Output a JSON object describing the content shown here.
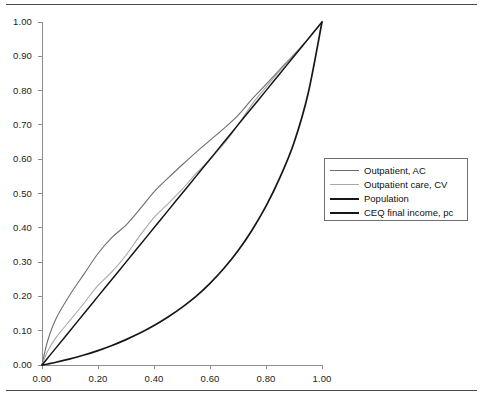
{
  "figure": {
    "name": "lorenz-concentration-curve-figure",
    "has_top_rule": true,
    "has_bottom_rule": true
  },
  "legend": {
    "position": "right-middle",
    "entries": [
      {
        "label": "Outpatient, AC",
        "color": "#6e6e6e",
        "width": 1.1
      },
      {
        "label": "Outpatient care, CV",
        "color": "#a8a8a8",
        "width": 1.1
      },
      {
        "label": "Population",
        "color": "#161616",
        "width": 1.5
      },
      {
        "label": "CEQ final income, pc",
        "color": "#161616",
        "width": 1.7
      }
    ]
  },
  "axes": {
    "x_tick_labels": [
      "0.00",
      "0.20",
      "0.40",
      "0.60",
      "0.80",
      "1.00"
    ],
    "y_tick_labels": [
      "0.00",
      "0.10",
      "0.20",
      "0.30",
      "0.40",
      "0.50",
      "0.60",
      "0.70",
      "0.80",
      "0.90",
      "1.00"
    ],
    "axis_color": "#8d8d8d"
  },
  "chart_data": {
    "type": "line",
    "title": "",
    "xlabel": "",
    "ylabel": "",
    "xlim": [
      0,
      1
    ],
    "ylim": [
      0,
      1
    ],
    "grid": false,
    "legend_position": "right",
    "x": [
      0.0,
      0.02,
      0.05,
      0.1,
      0.15,
      0.2,
      0.25,
      0.3,
      0.35,
      0.4,
      0.45,
      0.5,
      0.55,
      0.6,
      0.65,
      0.7,
      0.75,
      0.8,
      0.85,
      0.9,
      0.95,
      1.0
    ],
    "series": [
      {
        "name": "Outpatient, AC",
        "color": "#6e6e6e",
        "values": [
          0.0,
          0.07,
          0.135,
          0.205,
          0.265,
          0.325,
          0.372,
          0.408,
          0.455,
          0.505,
          0.545,
          0.583,
          0.62,
          0.655,
          0.69,
          0.728,
          0.775,
          0.818,
          0.862,
          0.905,
          0.95,
          1.0
        ]
      },
      {
        "name": "Outpatient care, CV",
        "color": "#a8a8a8",
        "values": [
          0.0,
          0.04,
          0.08,
          0.13,
          0.18,
          0.232,
          0.272,
          0.32,
          0.378,
          0.43,
          0.47,
          0.512,
          0.558,
          0.6,
          0.645,
          0.7,
          0.76,
          0.81,
          0.858,
          0.903,
          0.95,
          1.0
        ]
      },
      {
        "name": "Population",
        "color": "#161616",
        "values": [
          0.0,
          0.02,
          0.05,
          0.1,
          0.15,
          0.2,
          0.25,
          0.3,
          0.35,
          0.4,
          0.45,
          0.5,
          0.55,
          0.6,
          0.65,
          0.7,
          0.75,
          0.8,
          0.85,
          0.9,
          0.95,
          1.0
        ]
      },
      {
        "name": "CEQ final income, pc",
        "color": "#161616",
        "values": [
          0.0,
          0.003,
          0.008,
          0.018,
          0.029,
          0.042,
          0.057,
          0.074,
          0.093,
          0.115,
          0.14,
          0.168,
          0.2,
          0.238,
          0.282,
          0.333,
          0.393,
          0.463,
          0.547,
          0.648,
          0.79,
          1.0
        ]
      }
    ]
  }
}
